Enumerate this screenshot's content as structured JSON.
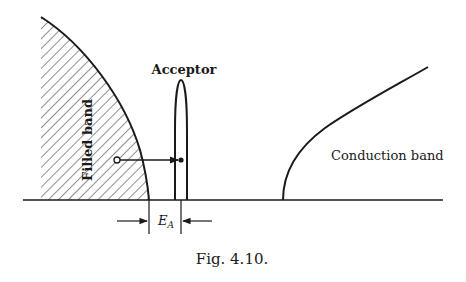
{
  "figure": {
    "caption": "Fig. 4.10.",
    "labels": {
      "filled_band": "Filled band",
      "acceptor": "Acceptor",
      "conduction_band": "Conduction band",
      "energy_gap_symbol": "E",
      "energy_gap_subscript": "A"
    },
    "colors": {
      "ink": "#1a1a1a",
      "background": "#ffffff"
    }
  }
}
